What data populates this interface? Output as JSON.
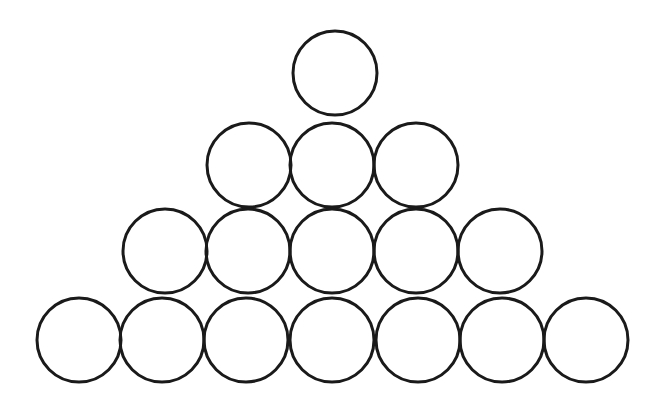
{
  "figure": {
    "name": "circle-pyramid",
    "background_color": "#ffffff",
    "stroke_color": "#1a1a1a",
    "stroke_width": 3,
    "fill": "none",
    "canvas": {
      "width": 666,
      "height": 409
    },
    "total_circles": 16,
    "row_counts": [
      1,
      3,
      5,
      7
    ],
    "radius": 42,
    "rows": [
      {
        "index": 1,
        "count": 1,
        "center_y": 73,
        "circles": [
          {
            "id": "r1c1",
            "cx": 335,
            "cy": 73,
            "r": 42
          }
        ]
      },
      {
        "index": 2,
        "count": 3,
        "center_y": 165,
        "circles": [
          {
            "id": "r2c1",
            "cx": 249,
            "cy": 165,
            "r": 42
          },
          {
            "id": "r2c2",
            "cx": 332,
            "cy": 165,
            "r": 42
          },
          {
            "id": "r2c3",
            "cx": 416,
            "cy": 165,
            "r": 42
          }
        ]
      },
      {
        "index": 3,
        "count": 5,
        "center_y": 251,
        "circles": [
          {
            "id": "r3c1",
            "cx": 165,
            "cy": 251,
            "r": 42
          },
          {
            "id": "r3c2",
            "cx": 248,
            "cy": 251,
            "r": 42
          },
          {
            "id": "r3c3",
            "cx": 332,
            "cy": 251,
            "r": 42
          },
          {
            "id": "r3c4",
            "cx": 416,
            "cy": 251,
            "r": 42
          },
          {
            "id": "r3c5",
            "cx": 500,
            "cy": 251,
            "r": 42
          }
        ]
      },
      {
        "index": 4,
        "count": 7,
        "center_y": 340,
        "circles": [
          {
            "id": "r4c1",
            "cx": 79,
            "cy": 340,
            "r": 42
          },
          {
            "id": "r4c2",
            "cx": 162,
            "cy": 340,
            "r": 42
          },
          {
            "id": "r4c3",
            "cx": 246,
            "cy": 340,
            "r": 42
          },
          {
            "id": "r4c4",
            "cx": 332,
            "cy": 340,
            "r": 42
          },
          {
            "id": "r4c5",
            "cx": 418,
            "cy": 340,
            "r": 42
          },
          {
            "id": "r4c6",
            "cx": 502,
            "cy": 340,
            "r": 42
          },
          {
            "id": "r4c7",
            "cx": 586,
            "cy": 340,
            "r": 42
          }
        ]
      }
    ]
  }
}
